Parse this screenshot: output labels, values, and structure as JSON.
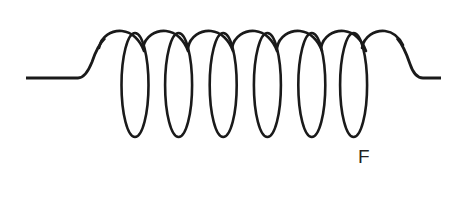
{
  "figure": {
    "kind": "coil-inductor-diagram",
    "title": "",
    "background_color": "#ffffff",
    "stroke_color": "#1a1a1a",
    "width": 466,
    "height": 205,
    "labels": [
      {
        "id": "force-label",
        "text": "F",
        "color": "#231f20",
        "x": 358,
        "y": 147
      }
    ],
    "coil": {
      "turns": 6,
      "loop_centers_x": [
        135,
        178,
        223,
        267,
        312,
        353
      ],
      "loop_top_y": 33,
      "loop_bottom_y": 137,
      "loop_half_width": 13,
      "crossing_y": 45,
      "arc_peak_y": 31
    },
    "leads": {
      "left": {
        "start_x": 26,
        "start_y": 78,
        "bend_x": 78,
        "bend_y": 78,
        "end_x": 100,
        "end_y": 42
      },
      "right": {
        "start_x": 392,
        "start_y": 42,
        "bend_x": 415,
        "bend_y": 78,
        "end_x": 441,
        "end_y": 78
      }
    }
  }
}
